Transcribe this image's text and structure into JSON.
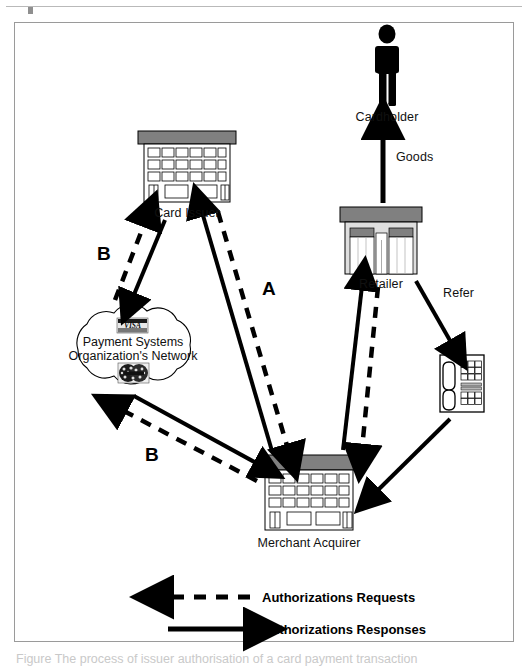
{
  "figure": {
    "bottom_caption_fragment": "Figure    The process of issuer authorisation of a card payment transaction"
  },
  "nodes": {
    "cardholder": {
      "label": "Cardholder",
      "icon": "person-icon"
    },
    "card_issuer": {
      "label": "Card Issuer",
      "icon": "office-building-icon"
    },
    "network": {
      "line1": "Payment Systems",
      "line2": "Organization's Network",
      "icon": "cloud-icon",
      "logos": [
        {
          "name": "visa-logo",
          "text": "VISA"
        },
        {
          "name": "mastercard-logo",
          "text": "MasterCard"
        }
      ]
    },
    "retailer": {
      "label": "Retailer",
      "icon": "storefront-icon"
    },
    "telephone": {
      "label": "",
      "icon": "telephone-icon"
    },
    "merchant_acquirer": {
      "label": "Merchant Acquirer",
      "icon": "office-building-icon"
    }
  },
  "flow_labels": {
    "goods": "Goods",
    "refer": "Refer",
    "route_a": "A",
    "route_b_upper": "B",
    "route_b_lower": "B"
  },
  "legend": {
    "request": {
      "label": "Authorizations Requests",
      "style": "dashed",
      "direction": "left"
    },
    "response": {
      "label": "Authorizations Responses",
      "style": "solid",
      "direction": "right"
    }
  },
  "colors": {
    "line": "#000000",
    "roof_gray": "#808080",
    "wall_gray": "#d8d8d8",
    "frame_border": "#9a9a9a",
    "caption_gray": "#c9c9c9"
  }
}
